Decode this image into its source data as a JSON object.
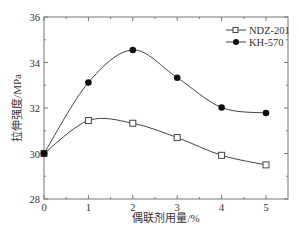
{
  "chart_data": {
    "type": "line",
    "title": "",
    "xlabel": "偶联剂用量/%",
    "ylabel": "拉伸强度/MPa",
    "x": [
      0,
      1,
      2,
      3,
      4,
      5
    ],
    "xlim": [
      0,
      5.5
    ],
    "ylim": [
      28,
      36
    ],
    "xticks": [
      0,
      1,
      2,
      3,
      4,
      5
    ],
    "yticks": [
      28,
      30,
      32,
      34,
      36
    ],
    "grid": false,
    "legend_position": "upper right",
    "series": [
      {
        "name": "NDZ-201",
        "marker": "open-square",
        "color": "#333333",
        "values": [
          30.0,
          31.45,
          31.33,
          30.7,
          29.92,
          29.5
        ]
      },
      {
        "name": "KH-570",
        "marker": "filled-circle",
        "color": "#222222",
        "values": [
          30.0,
          33.12,
          34.55,
          33.33,
          32.02,
          31.78
        ]
      }
    ]
  }
}
